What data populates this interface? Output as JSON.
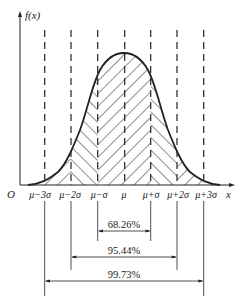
{
  "diagram": {
    "y_axis_label": "f(x)",
    "x_axis_label": "x",
    "origin_label": "O",
    "tick_labels": [
      "μ−3σ",
      "μ−2σ",
      "μ−σ",
      "μ",
      "μ+σ",
      "μ+2σ",
      "μ+3σ"
    ],
    "intervals": [
      {
        "label": "68.26%",
        "from": "μ−σ",
        "to": "μ+σ"
      },
      {
        "label": "95.44%",
        "from": "μ−2σ",
        "to": "μ+2σ"
      },
      {
        "label": "99.73%",
        "from": "μ−3σ",
        "to": "μ+3σ"
      }
    ],
    "colors": {
      "ink": "#222222",
      "background": "#ffffff"
    }
  }
}
